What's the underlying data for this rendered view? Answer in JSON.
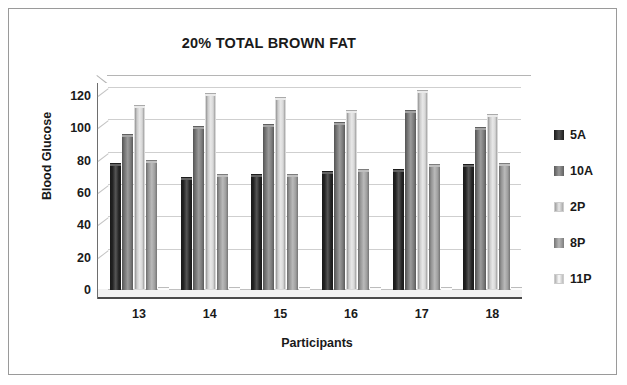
{
  "figure": {
    "background": "#ffffff",
    "border_color": "#9a9a9a"
  },
  "chart_data": {
    "type": "bar",
    "title": "20% TOTAL BROWN FAT",
    "xlabel": "Participants",
    "ylabel": "Blood Glucose",
    "categories": [
      "13",
      "14",
      "15",
      "16",
      "17",
      "18"
    ],
    "yticks": [
      0,
      20,
      40,
      60,
      80,
      100,
      120
    ],
    "ylim": [
      0,
      128
    ],
    "grid": true,
    "legend_position": "right",
    "series": [
      {
        "name": "5A",
        "color": "#262626",
        "values": [
          78,
          69,
          71,
          73,
          74,
          77
        ]
      },
      {
        "name": "10A",
        "color": "#808080",
        "values": [
          96,
          101,
          102,
          103,
          111,
          100
        ]
      },
      {
        "name": "2P",
        "color": "#e2e2e2",
        "values": [
          114,
          121,
          119,
          111,
          123,
          108
        ]
      },
      {
        "name": "8P",
        "color": "#a6a6a6",
        "values": [
          80,
          71,
          71,
          74,
          77,
          78
        ]
      },
      {
        "name": "11P",
        "color": "#fbfbfb",
        "values": [
          1,
          1,
          1,
          1,
          1,
          1
        ]
      }
    ]
  }
}
